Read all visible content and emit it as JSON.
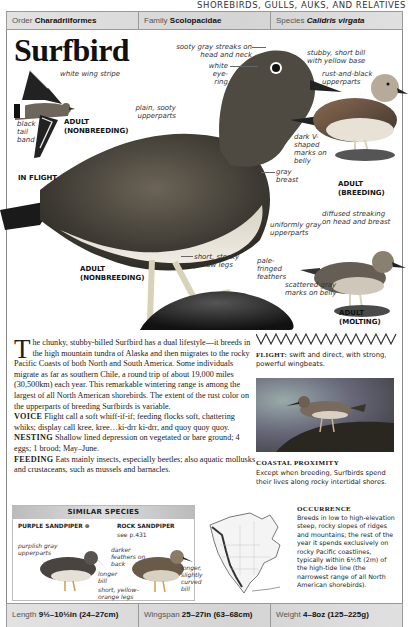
{
  "running_head": "SHOREBIRDS, GULLS, AUKS, AND RELATIVES",
  "taxonomy": {
    "order_label": "Order",
    "order_value": "Charadriiformes",
    "family_label": "Family",
    "family_value": "Scolopacidae",
    "species_label": "Species",
    "species_value": "Calidris virgata"
  },
  "title": "Surfbird",
  "illustrations": {
    "in_flight": {
      "caption": "IN FLIGHT",
      "sub_caption": "ADULT (NONBREEDING)",
      "labels": [
        "white wing stripe",
        "black tail band"
      ]
    },
    "main": {
      "caption": "ADULT (NONBREEDING)",
      "labels": [
        "sooty gray streaks on head and neck",
        "white eye-ring",
        "plain, sooty upperparts",
        "gray breast",
        "short, stocky yellow legs"
      ]
    },
    "breeding": {
      "caption": "ADULT (BREEDING)",
      "labels": [
        "stubby, short bill with yellow base",
        "rust-and-black upperparts",
        "dark V-shaped marks on belly"
      ]
    },
    "molting": {
      "caption": "ADULT (MOLTING)",
      "labels": [
        "diffused streaking on head and breast",
        "uniformly gray upperparts",
        "pale-fringed feathers",
        "scattered gray marks on belly"
      ]
    }
  },
  "description": {
    "dropcap": "T",
    "intro": "he chunky, stubby-billed Surfbird has a dual lifestyle—it breeds in the high mountain tundra of Alaska and then migrates to the rocky Pacific Coasts of both North and South America. Some individuals migrate as far as southern Chile, a round trip of about 19,000 miles (30,500km) each year. This remarkable wintering range is among the largest of all North American shorebirds. The extent of the rust color on the upperparts of breeding Surfbirds is variable.",
    "voice_label": "VOICE",
    "voice_text": "Flight call a soft whiff-if-if; feeding flocks soft, chattering whiks; display call kree, kree…ki-drr ki-drr, and quoy quoy quoy.",
    "nesting_label": "NESTING",
    "nesting_text": "Shallow lined depression on vegetated or bare ground; 4 eggs; 1 brood; May–June.",
    "feeding_label": "FEEDING",
    "feeding_text": "Eats mainly insects, especially beetles; also aquatic mollusks and crustaceans, such as mussels and barnacles."
  },
  "flight": {
    "label": "FLIGHT:",
    "text": "swift and direct, with strong, powerful wingbeats."
  },
  "photo": {
    "title": "COASTAL PROXIMITY",
    "caption": "Except when breeding, Surfbirds spend their lives along rocky intertidal shores."
  },
  "similar_species": {
    "heading": "SIMILAR SPECIES",
    "species": [
      {
        "name": "PURPLE SANDPIPER ⊛",
        "ref": "",
        "labels": [
          "purplish gray upperparts",
          "longer bill"
        ]
      },
      {
        "name": "ROCK SANDPIPER",
        "ref": "see p.431",
        "labels": [
          "darker feathers on back",
          "longer, slightly curved bill",
          "short, yellow-orange legs"
        ]
      }
    ]
  },
  "occurrence": {
    "title": "OCCURRENCE",
    "text": "Breeds in low to high-elevation steep, rocky slopes of ridges and mountains; the rest of the year it spends exclusively on rocky Pacific coastlines, typically within 6½ft (2m) of the high-tide line (the narrowest range of all North American shorebirds)."
  },
  "measurements": {
    "length_label": "Length",
    "length_value": "9½–10½in (24–27cm)",
    "wingspan_label": "Wingspan",
    "wingspan_value": "25–27in (63–68cm)",
    "weight_label": "Weight",
    "weight_value": "4–8oz (125–225g)"
  }
}
